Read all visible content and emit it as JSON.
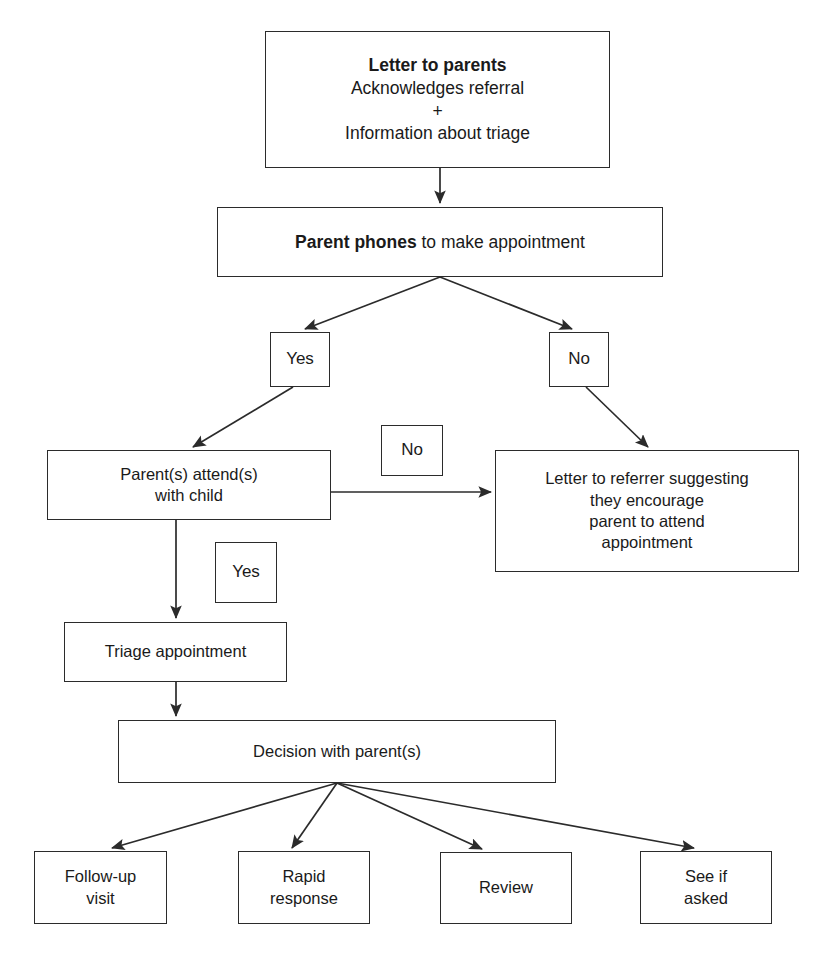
{
  "diagram": {
    "type": "flowchart",
    "orientation": "top-down",
    "background_color": "#ffffff",
    "line_color": "#2b2b2b",
    "text_color": "#1a1a1a",
    "nodes": [
      {
        "id": "letter-to-parents",
        "shape": "rectangle",
        "lines": [
          "Letter to parents",
          "Acknowledges referral",
          "+",
          "Information about triage"
        ],
        "line_styles": [
          "bold",
          "normal",
          "normal",
          "normal"
        ],
        "x": 265,
        "y": 31,
        "w": 345,
        "h": 137
      },
      {
        "id": "parent-phones",
        "shape": "rectangle",
        "lines": [
          "Parent phones to make appointment"
        ],
        "bold_prefix": "Parent phones",
        "rest": " to make appointment",
        "x": 217,
        "y": 207,
        "w": 446,
        "h": 70
      },
      {
        "id": "yes-phone",
        "shape": "rectangle",
        "lines": [
          "Yes"
        ],
        "x": 270,
        "y": 332,
        "w": 60,
        "h": 55
      },
      {
        "id": "no-phone",
        "shape": "rectangle",
        "lines": [
          "No"
        ],
        "x": 549,
        "y": 332,
        "w": 60,
        "h": 55
      },
      {
        "id": "parents-attend",
        "shape": "rectangle",
        "lines": [
          "Parent(s) attend(s)",
          "with child"
        ],
        "x": 47,
        "y": 450,
        "w": 284,
        "h": 70
      },
      {
        "id": "no-attend",
        "shape": "rectangle",
        "lines": [
          "No"
        ],
        "x": 381,
        "y": 425,
        "w": 62,
        "h": 51
      },
      {
        "id": "letter-to-referrer",
        "shape": "rectangle",
        "lines": [
          "Letter to referrer suggesting",
          "they encourage",
          "parent to attend",
          "appointment"
        ],
        "x": 495,
        "y": 450,
        "w": 304,
        "h": 122
      },
      {
        "id": "yes-attend",
        "shape": "rectangle",
        "lines": [
          "Yes"
        ],
        "x": 215,
        "y": 542,
        "w": 62,
        "h": 61
      },
      {
        "id": "triage-appointment",
        "shape": "rectangle",
        "lines": [
          "Triage appointment"
        ],
        "x": 64,
        "y": 622,
        "w": 223,
        "h": 60
      },
      {
        "id": "decision-with-parents",
        "shape": "rectangle",
        "lines": [
          "Decision with parent(s)"
        ],
        "x": 118,
        "y": 720,
        "w": 438,
        "h": 63
      },
      {
        "id": "follow-up-visit",
        "shape": "rectangle",
        "lines": [
          "Follow-up",
          "visit"
        ],
        "x": 34,
        "y": 851,
        "w": 133,
        "h": 73
      },
      {
        "id": "rapid-response",
        "shape": "rectangle",
        "lines": [
          "Rapid",
          "response"
        ],
        "x": 238,
        "y": 851,
        "w": 132,
        "h": 73
      },
      {
        "id": "review",
        "shape": "rectangle",
        "lines": [
          "Review"
        ],
        "x": 440,
        "y": 852,
        "w": 132,
        "h": 72
      },
      {
        "id": "see-if-asked",
        "shape": "rectangle",
        "lines": [
          "See if",
          "asked"
        ],
        "x": 640,
        "y": 851,
        "w": 132,
        "h": 73
      }
    ],
    "edges": [
      {
        "from": "letter-to-parents",
        "to": "parent-phones",
        "style": "arrow"
      },
      {
        "from": "parent-phones",
        "to": "yes-phone",
        "style": "arrow"
      },
      {
        "from": "parent-phones",
        "to": "no-phone",
        "style": "arrow"
      },
      {
        "from": "yes-phone",
        "to": "parents-attend",
        "style": "arrow"
      },
      {
        "from": "no-phone",
        "to": "letter-to-referrer",
        "style": "arrow"
      },
      {
        "from": "parents-attend",
        "to": "letter-to-referrer",
        "style": "arrow",
        "label": "No"
      },
      {
        "from": "parents-attend",
        "to": "triage-appointment",
        "style": "arrow",
        "label": "Yes"
      },
      {
        "from": "triage-appointment",
        "to": "decision-with-parents",
        "style": "arrow"
      },
      {
        "from": "decision-with-parents",
        "to": "follow-up-visit",
        "style": "arrow"
      },
      {
        "from": "decision-with-parents",
        "to": "rapid-response",
        "style": "arrow"
      },
      {
        "from": "decision-with-parents",
        "to": "review",
        "style": "arrow"
      },
      {
        "from": "decision-with-parents",
        "to": "see-if-asked",
        "style": "arrow"
      }
    ]
  },
  "nodes_text": {
    "letter_to_parents": {
      "l1": "Letter to parents",
      "l2": "Acknowledges referral",
      "l3": "+",
      "l4": "Information about triage"
    },
    "parent_phones": {
      "bold": "Parent phones",
      "rest": " to make appointment"
    },
    "yes_phone": {
      "label": "Yes"
    },
    "no_phone": {
      "label": "No"
    },
    "parents_attend": {
      "l1": "Parent(s) attend(s)",
      "l2": "with child"
    },
    "no_attend": {
      "label": "No"
    },
    "letter_to_referrer": {
      "l1": "Letter to referrer suggesting",
      "l2": "they encourage",
      "l3": "parent to attend",
      "l4": "appointment"
    },
    "yes_attend": {
      "label": "Yes"
    },
    "triage_appointment": {
      "label": "Triage appointment"
    },
    "decision_with_parents": {
      "label": "Decision with parent(s)"
    },
    "follow_up_visit": {
      "l1": "Follow-up",
      "l2": "visit"
    },
    "rapid_response": {
      "l1": "Rapid",
      "l2": "response"
    },
    "review": {
      "label": "Review"
    },
    "see_if_asked": {
      "l1": "See if",
      "l2": "asked"
    }
  }
}
